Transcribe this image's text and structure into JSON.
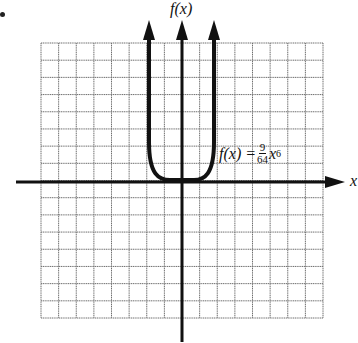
{
  "chart_data": {
    "type": "line",
    "title": "",
    "xlabel": "x",
    "ylabel": "f(x)",
    "grid": true,
    "grid_columns": 16,
    "grid_rows": 16,
    "axis_ticks_labeled": false,
    "function": "f(x) = (9/64) x^6",
    "annotation": {
      "text_prefix": "f(x) = ",
      "numerator": "9",
      "denominator": "64",
      "variable": "x",
      "exponent": "6"
    },
    "series": [
      {
        "name": "f(x) = 9/64 x^6",
        "x": [
          -2,
          -1.75,
          -1.5,
          -1.25,
          -1,
          -0.5,
          0,
          0.5,
          1,
          1.25,
          1.5,
          1.75,
          2
        ],
        "y": [
          9,
          4.16,
          1.6,
          0.54,
          0.14,
          0.002,
          0,
          0.002,
          0.14,
          0.54,
          1.6,
          4.16,
          9
        ]
      }
    ],
    "xlim": [
      -8,
      8
    ],
    "ylim": [
      -8,
      8
    ],
    "legend_position": "none",
    "colors": {
      "grid": "#6f6f6f",
      "axis": "#111111",
      "curve": "#111111",
      "background": "#ffffff"
    }
  },
  "labels": {
    "y_axis": "f(x)",
    "x_axis": "x",
    "eq_prefix": "f(x) =",
    "eq_num": "9",
    "eq_den": "64",
    "eq_var": "x",
    "eq_exp": "6"
  }
}
